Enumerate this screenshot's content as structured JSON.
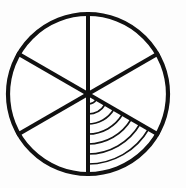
{
  "figure": {
    "name": "sectored-circle-with-concentric-arcs",
    "title": "Circle divided into six sectors with concentric arcs in one sector region",
    "background_color": "#fdfdfd",
    "stroke_color": "#111111",
    "arc_stroke_color": "#141414",
    "fill_color": "#ffffff"
  },
  "chart_data": {
    "type": "pie",
    "title": "",
    "categories": [
      "1",
      "2",
      "3",
      "4",
      "5",
      "6"
    ],
    "values": [
      1,
      1,
      1,
      1,
      1,
      1
    ],
    "slice_count": 6,
    "slice_degrees": 60,
    "legend": "none",
    "grid": false
  },
  "geometry": {
    "center_x": 88,
    "center_y": 94,
    "radius": 82,
    "circle_stroke_width": 4.2,
    "spoke_stroke_width": 4.0,
    "arc_stroke_width": 1.7,
    "spoke_angles_deg": [
      90,
      270,
      30,
      210,
      150,
      330
    ],
    "arc_count": 8,
    "arc_start_angle_deg": 30,
    "arc_end_angle_deg": 90,
    "arc_radii": [
      10,
      20,
      30,
      40,
      50,
      60,
      70,
      80
    ]
  },
  "labels": {
    "outer_circle": "outer-circle",
    "spoke_vertical": "spoke-vertical",
    "spoke_diagonal_a": "spoke-diagonal-upper-right",
    "spoke_diagonal_b": "spoke-diagonal-upper-left",
    "arc_group": "concentric-arc-group"
  }
}
